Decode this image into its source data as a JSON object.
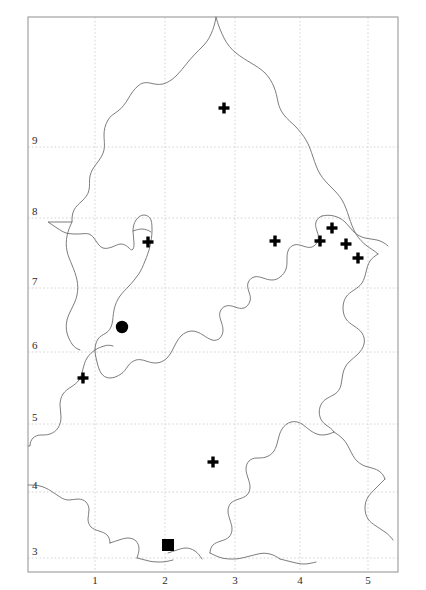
{
  "figure": {
    "kind": "distribution-map",
    "background_color": "#ffffff",
    "frame_color": "#9a9a9a",
    "grid_color": "#c9c9c9",
    "coast_color": "#6e6e6e",
    "marker_color": "#000000"
  },
  "frame": {
    "x": 28,
    "y": 17,
    "width": 370,
    "height": 555
  },
  "axes": {
    "x_ticks": [
      {
        "label": "1",
        "px": 95
      },
      {
        "label": "2",
        "px": 165
      },
      {
        "label": "3",
        "px": 235
      },
      {
        "label": "4",
        "px": 300
      },
      {
        "label": "5",
        "px": 368
      }
    ],
    "y_ticks": [
      {
        "label": "9",
        "px": 147
      },
      {
        "label": "8",
        "px": 218
      },
      {
        "label": "7",
        "px": 288
      },
      {
        "label": "6",
        "px": 352
      },
      {
        "label": "5",
        "px": 424
      },
      {
        "label": "4",
        "px": 492
      },
      {
        "label": "3",
        "px": 558
      }
    ]
  },
  "chart_data": {
    "type": "scatter",
    "title": "",
    "xlabel": "",
    "ylabel": "",
    "xlim": [
      0,
      6
    ],
    "ylim": [
      2,
      10
    ],
    "grid": true,
    "legend": null,
    "series": [
      {
        "name": "cross",
        "symbol": "plus",
        "count": 9,
        "points": [
          {
            "x": 224,
            "y": 108
          },
          {
            "x": 148,
            "y": 242
          },
          {
            "x": 275,
            "y": 241
          },
          {
            "x": 320,
            "y": 241
          },
          {
            "x": 332,
            "y": 228
          },
          {
            "x": 346,
            "y": 244
          },
          {
            "x": 358,
            "y": 258
          },
          {
            "x": 83,
            "y": 378
          },
          {
            "x": 213,
            "y": 462
          }
        ]
      },
      {
        "name": "circle",
        "symbol": "filled-circle",
        "count": 1,
        "points": [
          {
            "x": 122,
            "y": 327
          }
        ]
      },
      {
        "name": "square",
        "symbol": "filled-square",
        "count": 1,
        "points": [
          {
            "x": 168,
            "y": 545
          }
        ]
      }
    ]
  }
}
